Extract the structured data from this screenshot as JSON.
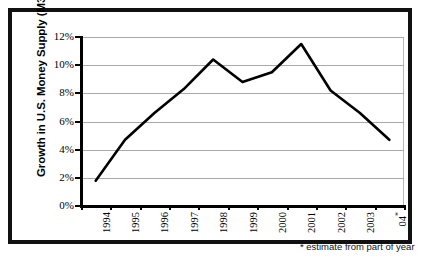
{
  "chart_data": {
    "type": "line",
    "title": "",
    "xlabel": "",
    "ylabel": "Growth in U.S. Money Supply (M3)",
    "categories": [
      "1994",
      "1995",
      "1996",
      "1997",
      "1998",
      "1999",
      "2000",
      "2001",
      "2002",
      "2003",
      "04*"
    ],
    "values": [
      1.8,
      4.7,
      6.6,
      8.3,
      10.4,
      8.8,
      9.5,
      11.5,
      8.2,
      6.6,
      4.7
    ],
    "series": [
      {
        "name": "Growth in U.S. Money Supply (M3)",
        "values": [
          1.8,
          4.7,
          6.6,
          8.3,
          10.4,
          8.8,
          9.5,
          11.5,
          8.2,
          6.6,
          4.7
        ]
      }
    ],
    "ylim": [
      0,
      12
    ],
    "ytick_labels": [
      "0%",
      "2%",
      "4%",
      "6%",
      "8%",
      "10%",
      "12%"
    ],
    "ytick_values": [
      0,
      2,
      4,
      6,
      8,
      10,
      12
    ],
    "grid": true,
    "legend": "none",
    "annotations": [
      "* estimate from part of year"
    ],
    "line_color": "#000000",
    "grid_color": "#a9a9a9",
    "background_color": "#ffffff"
  },
  "axis": {
    "y_title": "Growth in U.S. Money Supply (M3)"
  },
  "footnote": {
    "text": "* estimate from part of year"
  }
}
